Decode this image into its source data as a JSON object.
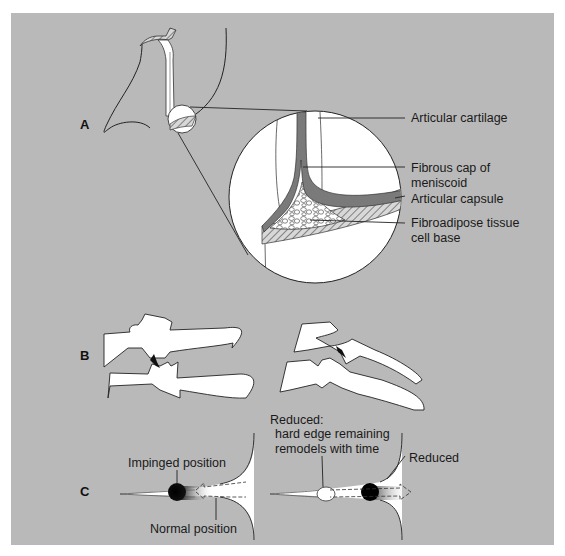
{
  "figure": {
    "panel_color": "#b9b9b9",
    "parts": [
      {
        "id": "A",
        "label": "A"
      },
      {
        "id": "B",
        "label": "B"
      },
      {
        "id": "C",
        "label": "C"
      }
    ],
    "part_a": {
      "labels": [
        "Articular cartilage",
        "Fibrous cap of",
        "meniscoid",
        "Articular capsule",
        "Fibroadipose tissue",
        "cell base"
      ]
    },
    "part_c": {
      "left": {
        "impinged_label": "Impinged position",
        "normal_label": "Normal position"
      },
      "right": {
        "reduced_title": "Reduced:",
        "reduced_line2": "hard edge remaining",
        "reduced_line3": "remodels with time",
        "reduced_arrow_label": "Reduced"
      }
    },
    "caption_partial": "7.9"
  }
}
